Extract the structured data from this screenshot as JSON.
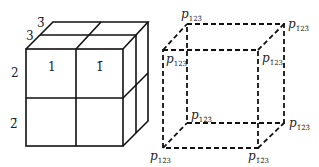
{
  "diagram": {
    "left_cube": {
      "description": "2x2x2 cube subdivided into 8 cells",
      "labels": {
        "axis1_front_left": "1",
        "axis1_front_right": "1̄",
        "axis2_top": "2",
        "axis2_bottom": "2̄",
        "axis3_front": "3",
        "axis3_back": "3̄"
      }
    },
    "right_cube": {
      "description": "dashed cube with labeled vertices",
      "vertices": {
        "front_top_left": {
          "base": "p",
          "sub": "123"
        },
        "front_top_right": {
          "base": "p",
          "sub": "1̄23"
        },
        "back_top_left": {
          "base": "p",
          "sub": "123̄"
        },
        "back_top_right": {
          "base": "p",
          "sub": "1̄23̄"
        },
        "back_bottom_left": {
          "base": "p",
          "sub": "12̄3̄"
        },
        "back_bottom_right": {
          "base": "p",
          "sub": "1̄2̄3̄"
        },
        "front_bottom_left": {
          "base": "p",
          "sub": "12̄3"
        },
        "front_bottom_right": {
          "base": "p",
          "sub": "1̄2̄3"
        }
      }
    }
  }
}
